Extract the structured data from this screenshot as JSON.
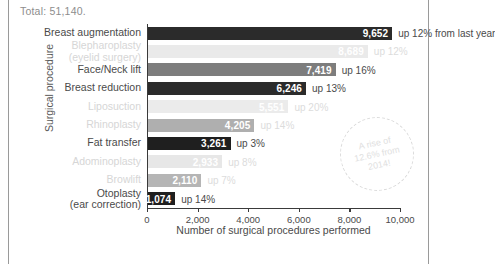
{
  "caption": {
    "total": "Total: 51,140."
  },
  "chart_data": {
    "type": "bar",
    "orientation": "horizontal",
    "title": "",
    "xlabel": "Number of surgical procedures performed",
    "ylabel": "Surgical procedure",
    "xlim": [
      0,
      10000
    ],
    "xticks": [
      "0",
      "2,000",
      "4,000",
      "6,000",
      "8,000",
      "10,000"
    ],
    "grid": false,
    "legend": "none",
    "categories": [
      "Breast augmentation",
      "Blepharoplasty (eyelid surgery)",
      "Face/Neck lift",
      "Breast reduction",
      "Liposuction",
      "Rhinoplasty",
      "Fat transfer",
      "Adominoplasty",
      "Browlift",
      "Otoplasty (ear correction)"
    ],
    "values": [
      9652,
      8689,
      7419,
      6246,
      5551,
      4205,
      3261,
      2933,
      2110,
      1074
    ],
    "value_labels": [
      "9,652",
      "8,689",
      "7,419",
      "6,246",
      "5,551",
      "4,205",
      "3,261",
      "2,933",
      "2,110",
      "1,074"
    ],
    "annotations": [
      "up 12% from last year",
      "up 12%",
      "up 16%",
      "up 13%",
      "up 20%",
      "up 14%",
      "up 3%",
      "up 8%",
      "up 7%",
      "up 14%"
    ],
    "bar_colors": [
      "#2b2b2b",
      "#d9d9d9",
      "#7d7d7d",
      "#2b2b2b",
      "#dcdcdc",
      "#6f6f6f",
      "#1f1f1f",
      "#d4d4d4",
      "#7a7a7a",
      "#1f1f1f"
    ],
    "callout": "A rise of\n12.6% from\n2014!"
  },
  "rows": [
    {
      "label_main": "Breast augmentation",
      "label_sub": "",
      "value": "9,652",
      "note": "up 12% from last year",
      "faded": false
    },
    {
      "label_main": "Blepharoplasty",
      "label_sub": "(eyelid surgery)",
      "value": "8,689",
      "note": "up 12%",
      "faded": true
    },
    {
      "label_main": "Face/Neck lift",
      "label_sub": "",
      "value": "7,419",
      "note": "up 16%",
      "faded": false
    },
    {
      "label_main": "Breast reduction",
      "label_sub": "",
      "value": "6,246",
      "note": "up 13%",
      "faded": false
    },
    {
      "label_main": "Liposuction",
      "label_sub": "",
      "value": "5,551",
      "note": "up 20%",
      "faded": true
    },
    {
      "label_main": "Rhinoplasty",
      "label_sub": "",
      "value": "4,205",
      "note": "up 14%",
      "faded": true
    },
    {
      "label_main": "Fat transfer",
      "label_sub": "",
      "value": "3,261",
      "note": "up 3%",
      "faded": false
    },
    {
      "label_main": "Adominoplasty",
      "label_sub": "",
      "value": "2,933",
      "note": "up 8%",
      "faded": true
    },
    {
      "label_main": "Browlift",
      "label_sub": "",
      "value": "2,110",
      "note": "up 7%",
      "faded": true
    },
    {
      "label_main": "Otoplasty",
      "label_sub": "(ear correction)",
      "value": "1,074",
      "note": "up 14%",
      "faded": false
    }
  ]
}
